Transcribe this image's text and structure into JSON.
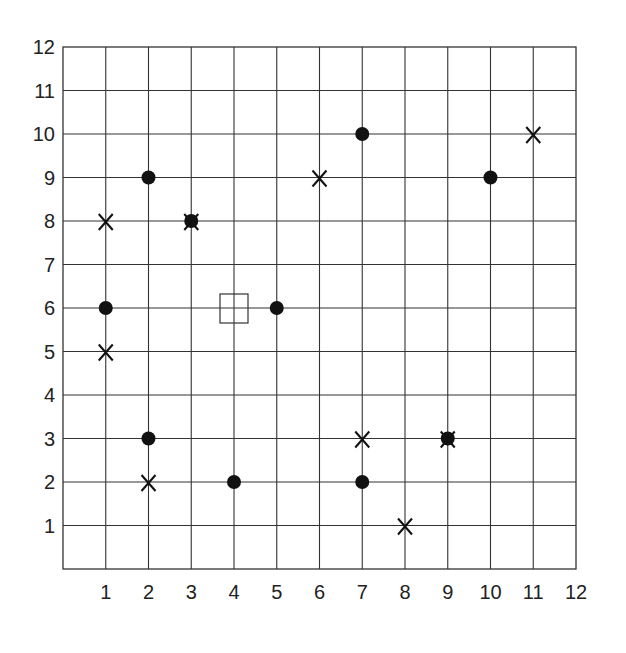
{
  "chart_data": {
    "type": "scatter",
    "title": "",
    "xlabel": "",
    "ylabel": "",
    "xlim": [
      0,
      12
    ],
    "ylim": [
      0,
      12
    ],
    "grid": true,
    "x_ticks": [
      1,
      2,
      3,
      4,
      5,
      6,
      7,
      8,
      9,
      10,
      11,
      12
    ],
    "y_ticks": [
      1,
      2,
      3,
      4,
      5,
      6,
      7,
      8,
      9,
      10,
      11,
      12
    ],
    "series": [
      {
        "name": "dots",
        "marker": "filled-circle",
        "points": [
          [
            2,
            9
          ],
          [
            3,
            8
          ],
          [
            1,
            6
          ],
          [
            5,
            6
          ],
          [
            7,
            10
          ],
          [
            10,
            9
          ],
          [
            2,
            3
          ],
          [
            4,
            2
          ],
          [
            7,
            2
          ],
          [
            9,
            3
          ]
        ]
      },
      {
        "name": "crosses",
        "marker": "x",
        "points": [
          [
            1,
            8
          ],
          [
            3,
            8
          ],
          [
            1,
            5
          ],
          [
            6,
            9
          ],
          [
            11,
            10
          ],
          [
            2,
            2
          ],
          [
            7,
            3
          ],
          [
            8,
            1
          ],
          [
            9,
            3
          ]
        ]
      },
      {
        "name": "square",
        "marker": "open-square",
        "points": [
          [
            4,
            6
          ]
        ]
      }
    ]
  },
  "colors": {
    "grid": "#333333",
    "marker": "#111111",
    "background": "#ffffff"
  }
}
